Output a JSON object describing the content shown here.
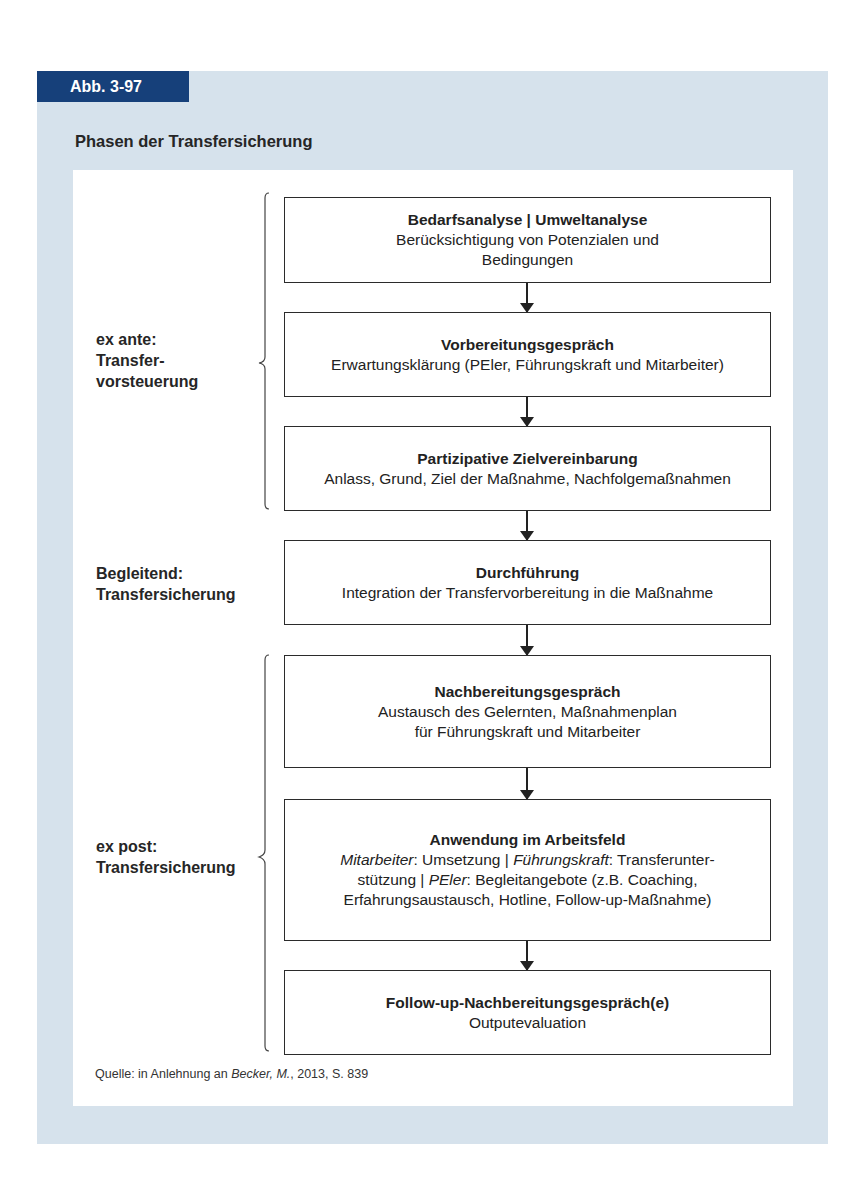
{
  "figure": {
    "label": "Abb. 3-97",
    "title": "Phasen der Transfersicherung",
    "colors": {
      "outer_panel": "#d6e2ec",
      "tab_background": "#16407a",
      "tab_text": "#ffffff",
      "inner_panel": "#ffffff",
      "box_border": "#2b2b2b"
    }
  },
  "phases": [
    {
      "label_line1": "ex ante:",
      "label_line2": "Transfer-",
      "label_line3": "vorsteuerung",
      "brace": "left-curly-brace"
    },
    {
      "label_line1": "Begleitend:",
      "label_line2": "Transfersicherung"
    },
    {
      "label_line1": "ex post:",
      "label_line2": "Transfersicherung",
      "brace": "left-curly-brace"
    }
  ],
  "steps": [
    {
      "title": "Bedarfsanalyse | Umweltanalyse",
      "line1": "Berücksichtigung von Potenzialen und",
      "line2": "Bedingungen"
    },
    {
      "title": "Vorbereitungsgespräch",
      "line1": "Erwartungsklärung (PEler, Führungskraft und Mitarbeiter)"
    },
    {
      "title": "Partizipative Zielvereinbarung",
      "line1": "Anlass, Grund, Ziel der Maßnahme, Nachfolgemaßnahmen"
    },
    {
      "title": "Durchführung",
      "line1": "Integration der Transfervorbereitung in die Maßnahme"
    },
    {
      "title": "Nachbereitungsgespräch",
      "line1": "Austausch des Gelernten, Maßnahmenplan",
      "line2": "für Führungskraft und Mitarbeiter"
    },
    {
      "title": "Anwendung im Arbeitsfeld",
      "role1": "Mitarbeiter",
      "text1": ": Umsetzung | ",
      "role2": "Führungskraft",
      "text2": ": Transferunter-",
      "text3": "stützung | ",
      "role3": "PEler",
      "text4": ": Begleitangebote (z.B. Coaching,",
      "line_last": "Erfahrungsaustausch, Hotline, Follow-up-Maßnahme)"
    },
    {
      "title": "Follow-up-Nachbereitungsgespräch(e)",
      "line1": "Outputevaluation"
    }
  ],
  "source": {
    "prefix": "Quelle: in Anlehnung an ",
    "author": "Becker, M.",
    "suffix": ", 2013, S. 839"
  }
}
